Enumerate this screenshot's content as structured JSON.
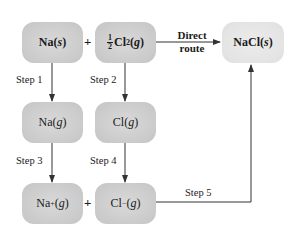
{
  "diagram": {
    "nodes": {
      "na_s": {
        "species": "Na",
        "state": "s",
        "bold": true
      },
      "half_cl2_g": {
        "coefficient_num": "1",
        "coefficient_den": "2",
        "species": "Cl",
        "subscript": "2",
        "state": "g",
        "bold": true
      },
      "nacl_s": {
        "species": "NaCl",
        "state": "s",
        "bold": true
      },
      "na_g": {
        "species": "Na",
        "state": "g"
      },
      "cl_g": {
        "species": "Cl",
        "state": "g"
      },
      "na_plus_g": {
        "species": "Na",
        "charge": "+",
        "state": "g"
      },
      "cl_minus_g": {
        "species": "Cl",
        "charge": "−",
        "state": "g"
      }
    },
    "plus_signs": [
      "+",
      "+"
    ],
    "edges": {
      "direct": {
        "line1": "Direct",
        "line2": "route"
      },
      "step1": "Step 1",
      "step2": "Step 2",
      "step3": "Step 3",
      "step4": "Step 4",
      "step5": "Step 5"
    },
    "colors": {
      "box_fill": "#cbcbcb",
      "product_fill": "#e4e4e4",
      "line": "#333333",
      "text": "#1a1a1a"
    }
  }
}
